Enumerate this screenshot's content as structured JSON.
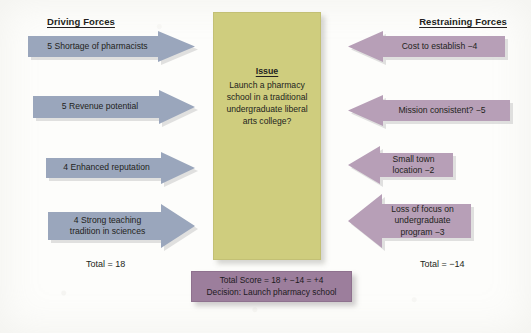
{
  "figure": {
    "driving_title": "Driving Forces",
    "restraining_title": "Restraining Forces",
    "driving_total": "Total = 18",
    "restraining_total": "Total = −14"
  },
  "issue": {
    "heading": "Issue",
    "text": "Launch a pharmacy school in a traditional undergraduate liberal arts college?"
  },
  "driving_forces": [
    {
      "label": "5 Shortage of pharmacists"
    },
    {
      "label": "5 Revenue potential"
    },
    {
      "label": "4 Enhanced reputation"
    },
    {
      "label": "4 Strong teaching\ntradition in sciences"
    }
  ],
  "restraining_forces": [
    {
      "label": "Cost to establish  −4"
    },
    {
      "label": "Mission consistent?  −5"
    },
    {
      "label": "Small town\nlocation −2"
    },
    {
      "label": "Loss of focus on\nundergraduate\nprogram −3"
    }
  ],
  "decision": {
    "score_line": "Total Score = 18 + −14 = +4",
    "decision_line": "Decision: Launch pharmacy school"
  },
  "colors": {
    "driving_arrow": "#9aa6bc",
    "restraining_arrow": "#b79fb7",
    "issue_box": "#cfcd7e",
    "decision_box": "#9c7e9c",
    "shadow": "#c9c9c9"
  }
}
